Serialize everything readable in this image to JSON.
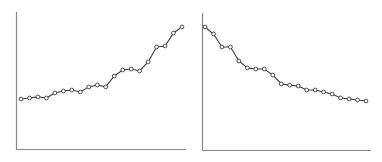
{
  "chart_data": [
    {
      "type": "line",
      "title": "",
      "xlabel": "",
      "ylabel": "",
      "grid": false,
      "legend": null,
      "ylim": [
        0,
        100
      ],
      "x": [
        1,
        2,
        3,
        4,
        5,
        6,
        7,
        8,
        9,
        10,
        11,
        12,
        13,
        14,
        15,
        16,
        17,
        18,
        19,
        20
      ],
      "series": [
        {
          "name": "increasing",
          "values": [
            36.5,
            37.2,
            38.0,
            37.2,
            40.9,
            42.3,
            43.1,
            41.6,
            45.3,
            46.7,
            45.3,
            53.3,
            57.7,
            58.4,
            56.9,
            63.5,
            74.5,
            75.2,
            84.7,
            89.1
          ]
        }
      ],
      "style": {
        "line_color": "#3a3a3a",
        "marker": "hollow-circle",
        "axis_color": "#888888"
      },
      "plot_box": {
        "x0": 16,
        "x1": 186,
        "y_top": 12,
        "y_bottom": 149,
        "first_x": 21,
        "last_x": 182
      }
    },
    {
      "type": "line",
      "title": "",
      "xlabel": "",
      "ylabel": "",
      "grid": false,
      "legend": null,
      "ylim": [
        0,
        100
      ],
      "x": [
        1,
        2,
        3,
        4,
        5,
        6,
        7,
        8,
        9,
        10,
        11,
        12,
        13,
        14,
        15,
        16,
        17,
        18,
        19,
        20
      ],
      "series": [
        {
          "name": "decreasing",
          "values": [
            89.8,
            84.7,
            75.2,
            75.2,
            65.0,
            59.9,
            59.1,
            59.1,
            54.7,
            48.2,
            47.4,
            46.7,
            43.8,
            43.8,
            42.3,
            40.9,
            38.0,
            37.2,
            36.5,
            35.8
          ]
        }
      ],
      "style": {
        "line_color": "#3a3a3a",
        "marker": "hollow-circle",
        "axis_color": "#888888"
      },
      "plot_box": {
        "x0": 202,
        "x1": 371,
        "y_top": 13,
        "y_bottom": 150,
        "first_x": 205,
        "last_x": 366
      }
    }
  ]
}
